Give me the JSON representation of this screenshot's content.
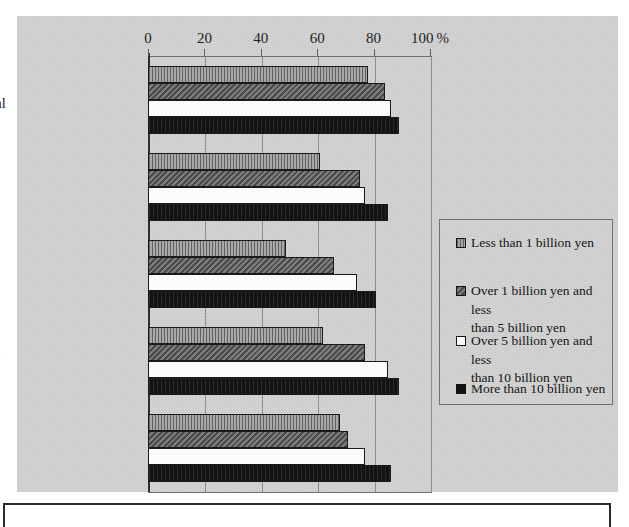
{
  "chart_data": {
    "type": "bar",
    "orientation": "horizontal",
    "title": "",
    "xlabel": "%",
    "ylabel": "",
    "xlim": [
      0,
      100
    ],
    "xticks": [
      0,
      20,
      40,
      60,
      80,
      100
    ],
    "xtick_labels": [
      "0",
      "20",
      "40",
      "60",
      "80",
      "100"
    ],
    "x_unit_suffix": "%",
    "grid": true,
    "legend_position": "right",
    "categories": [
      "Acquisition of computer/peripheral devices",
      "Acquisition of software",
      "Software development",
      "Systems operation and development",
      "Network build-up"
    ],
    "category_lines": [
      [
        "Acquisition of",
        "computer/peripheral",
        "devices"
      ],
      [
        "Acquisition of",
        "software"
      ],
      [
        "Software",
        "development"
      ],
      [
        "Systems operation",
        "and development"
      ],
      [
        "Network build-up"
      ]
    ],
    "series": [
      {
        "name": "Less than 1 billion yen",
        "name_lines": [
          "Less than 1 billion yen"
        ],
        "swatch": "light-gray-hatched",
        "color": "#a8a8a8",
        "values": [
          78,
          61,
          49,
          62,
          68
        ]
      },
      {
        "name": "Over 1 billion yen and less than 5 billion yen",
        "name_lines": [
          "Over 1 billion yen and less",
          "than 5 billion yen"
        ],
        "swatch": "dark-gray-hatched",
        "color": "#6e6e6e",
        "values": [
          84,
          75,
          66,
          77,
          71
        ]
      },
      {
        "name": "Over 5 billion yen and less than 10 billion yen",
        "name_lines": [
          "Over 5 billion yen and less",
          "than 10 billion yen"
        ],
        "swatch": "white",
        "color": "#fbfbfb",
        "values": [
          86,
          77,
          74,
          85,
          77
        ]
      },
      {
        "name": "More than 10 billion yen",
        "name_lines": [
          "More than 10 billion yen"
        ],
        "swatch": "black",
        "color": "#121212",
        "values": [
          89,
          85,
          81,
          89,
          86
        ]
      }
    ]
  }
}
